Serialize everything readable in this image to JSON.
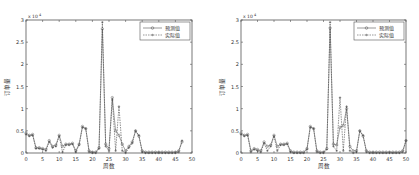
{
  "chart_data": [
    {
      "type": "line",
      "title": "",
      "xlabel": "周数",
      "ylabel": "订单量",
      "y_exponent": "x 10^4",
      "xlim": [
        0,
        50
      ],
      "ylim": [
        0,
        3
      ],
      "xticks": [
        0,
        5,
        10,
        15,
        20,
        25,
        30,
        35,
        40,
        45,
        50
      ],
      "yticks": [
        0,
        0.5,
        1,
        1.5,
        2,
        2.5,
        3
      ],
      "grid": false,
      "legend_position": "upper right",
      "x": [
        0,
        1,
        2,
        3,
        4,
        5,
        6,
        7,
        8,
        9,
        10,
        11,
        12,
        13,
        14,
        15,
        16,
        17,
        18,
        19,
        20,
        21,
        22,
        23,
        24,
        25,
        26,
        27,
        28,
        29,
        30,
        31,
        32,
        33,
        34,
        35,
        36,
        37,
        38,
        39,
        40,
        41,
        42,
        43,
        44,
        45,
        46,
        47
      ],
      "series": [
        {
          "name": "预测值",
          "marker": "o",
          "linestyle": "solid",
          "values": [
            0.45,
            0.4,
            0.42,
            0.12,
            0.12,
            0.1,
            0.08,
            0.28,
            0.15,
            0.18,
            0.4,
            0.15,
            0.2,
            0.2,
            0.22,
            0.05,
            0.2,
            0.6,
            0.55,
            0.05,
            0.02,
            0.02,
            0.12,
            2.8,
            0.2,
            0.1,
            1.25,
            0.5,
            0.4,
            0.2,
            0.05,
            0.15,
            0.25,
            0.5,
            0.38,
            0.05,
            0.02,
            0.02,
            0.02,
            0.02,
            0.02,
            0.02,
            0.02,
            0.02,
            0.02,
            0.02,
            0.05,
            0.25
          ]
        },
        {
          "name": "实际值",
          "marker": "+",
          "linestyle": "dashed",
          "values": [
            0.42,
            0.38,
            0.4,
            0.1,
            0.1,
            0.08,
            0.05,
            0.25,
            0.12,
            0.15,
            0.38,
            0.02,
            0.18,
            0.18,
            0.2,
            0.02,
            0.18,
            0.58,
            0.55,
            0.02,
            0.0,
            0.0,
            0.1,
            2.95,
            0.15,
            0.05,
            1.2,
            0.05,
            1.05,
            0.05,
            0.0,
            0.12,
            0.22,
            0.5,
            0.4,
            0.02,
            0.0,
            0.0,
            0.0,
            0.0,
            0.0,
            0.0,
            0.0,
            0.0,
            0.0,
            0.0,
            0.02,
            0.28
          ]
        }
      ]
    },
    {
      "type": "line",
      "title": "",
      "xlabel": "周数",
      "ylabel": "订单量",
      "y_exponent": "x 10^4",
      "xlim": [
        0,
        50
      ],
      "ylim": [
        0,
        3
      ],
      "xticks": [
        0,
        5,
        10,
        15,
        20,
        25,
        30,
        35,
        40,
        45,
        50
      ],
      "yticks": [
        0,
        0.5,
        1,
        1.5,
        2,
        2.5,
        3
      ],
      "grid": false,
      "legend_position": "upper right",
      "x": [
        0,
        1,
        2,
        3,
        4,
        5,
        6,
        7,
        8,
        9,
        10,
        11,
        12,
        13,
        14,
        15,
        16,
        17,
        18,
        19,
        20,
        21,
        22,
        23,
        24,
        25,
        26,
        27,
        28,
        29,
        30,
        31,
        32,
        33,
        34,
        35,
        36,
        37,
        38,
        39,
        40,
        41,
        42,
        43,
        44,
        45,
        46,
        47,
        48,
        49,
        50
      ],
      "series": [
        {
          "name": "预测值",
          "marker": "o",
          "linestyle": "solid",
          "values": [
            0.45,
            0.4,
            0.42,
            0.05,
            0.1,
            0.08,
            0.05,
            0.25,
            0.15,
            0.18,
            0.4,
            0.15,
            0.2,
            0.2,
            0.22,
            0.05,
            0.02,
            0.02,
            0.02,
            0.02,
            0.1,
            0.6,
            0.55,
            0.05,
            0.02,
            0.02,
            0.1,
            2.82,
            0.2,
            0.18,
            0.58,
            0.62,
            1.0,
            0.15,
            0.05,
            0.05,
            0.5,
            0.38,
            0.05,
            0.02,
            0.02,
            0.02,
            0.02,
            0.02,
            0.02,
            0.02,
            0.02,
            0.02,
            0.02,
            0.05,
            0.28
          ]
        },
        {
          "name": "实际值",
          "marker": "+",
          "linestyle": "dashed",
          "values": [
            0.42,
            0.38,
            0.4,
            0.02,
            0.08,
            0.05,
            0.02,
            0.22,
            0.05,
            0.15,
            0.38,
            0.05,
            0.18,
            0.18,
            0.2,
            0.02,
            0.0,
            0.0,
            0.0,
            0.0,
            0.08,
            0.58,
            0.55,
            0.02,
            0.0,
            0.0,
            0.08,
            2.95,
            0.15,
            0.05,
            1.25,
            0.05,
            1.05,
            0.05,
            0.0,
            0.02,
            0.5,
            0.4,
            0.02,
            0.0,
            0.0,
            0.0,
            0.0,
            0.0,
            0.0,
            0.0,
            0.0,
            0.0,
            0.0,
            0.02,
            0.28
          ]
        }
      ]
    }
  ]
}
